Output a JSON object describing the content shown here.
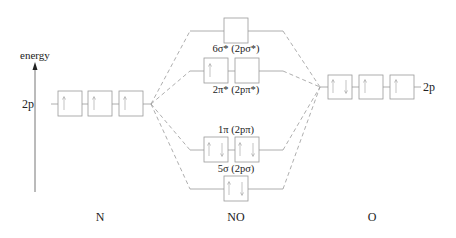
{
  "axis": {
    "label": "energy"
  },
  "columns": {
    "left": {
      "label": "N",
      "orbital_label": "2p",
      "electrons": [
        "up",
        "up",
        "up"
      ]
    },
    "middle": {
      "label": "NO"
    },
    "right": {
      "label": "O",
      "orbital_label": "2p",
      "electrons": [
        "updown",
        "up",
        "up"
      ]
    }
  },
  "mo_levels": [
    {
      "id": "6sigma-star",
      "label": "6σ* (2pσ*)",
      "boxes": [
        ""
      ],
      "label_position": "below"
    },
    {
      "id": "2pi-star",
      "label": "2π* (2pπ*)",
      "boxes": [
        "up",
        ""
      ],
      "label_position": "below"
    },
    {
      "id": "1pi",
      "label": "1π (2pπ)",
      "boxes": [
        "updown",
        "updown"
      ],
      "label_position": "above"
    },
    {
      "id": "5sigma",
      "label": "5σ (2pσ)",
      "boxes": [
        "updown"
      ],
      "label_position": "above"
    }
  ],
  "colors": {
    "line": "#888888",
    "dash": "#999999",
    "text": "#222222",
    "box": "#999999"
  }
}
